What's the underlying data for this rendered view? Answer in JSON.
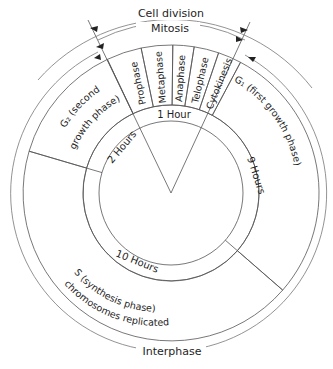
{
  "labels": {
    "cell_division": "Cell division",
    "mitosis": "Mitosis",
    "interphase": "Interphase"
  },
  "phases": {
    "prophase": "Prophase",
    "metaphase": "Metaphase",
    "anaphase": "Anaphase",
    "telophase": "Telophase",
    "cytokinesis": "Cytokinesis",
    "g1": "G₁ (first growth phase)",
    "s_line1": "S (synthesis phase)",
    "s_line2": "chromosomes replicated",
    "g2_line1": "G₂ (second",
    "g2_line2": "growth phase)"
  },
  "durations": {
    "mitosis": "1 Hour",
    "g1": "9 Hours",
    "s": "10 Hours",
    "g2": "2 Hours"
  },
  "colors": {
    "mitosis_fill": "#d6d6d6",
    "g1_fill": "#dadada",
    "s_fill": "#acacac",
    "g2_fill": "#a4a4a4",
    "line": "#555555",
    "text": "#1e1e1e"
  }
}
